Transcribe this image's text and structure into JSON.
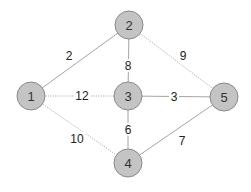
{
  "graph": {
    "nodes": [
      {
        "id": "1",
        "label": "1",
        "x": 31,
        "y": 96
      },
      {
        "id": "2",
        "label": "2",
        "x": 129,
        "y": 25
      },
      {
        "id": "3",
        "label": "3",
        "x": 128,
        "y": 96
      },
      {
        "id": "4",
        "label": "4",
        "x": 128,
        "y": 163
      },
      {
        "id": "5",
        "label": "5",
        "x": 224,
        "y": 97
      }
    ],
    "edges": [
      {
        "from": "1",
        "to": "2",
        "weight": "2",
        "style": "solid",
        "label_x": 69,
        "label_y": 56
      },
      {
        "from": "1",
        "to": "3",
        "weight": "12",
        "style": "dotted",
        "label_x": 82,
        "label_y": 96
      },
      {
        "from": "1",
        "to": "4",
        "weight": "10",
        "style": "dotted",
        "label_x": 77,
        "label_y": 139
      },
      {
        "from": "2",
        "to": "3",
        "weight": "8",
        "style": "solid",
        "label_x": 128,
        "label_y": 66
      },
      {
        "from": "2",
        "to": "5",
        "weight": "9",
        "style": "dotted",
        "label_x": 183,
        "label_y": 56
      },
      {
        "from": "3",
        "to": "5",
        "weight": "3",
        "style": "solid",
        "label_x": 174,
        "label_y": 97
      },
      {
        "from": "3",
        "to": "4",
        "weight": "6",
        "style": "solid",
        "label_x": 128,
        "label_y": 130
      },
      {
        "from": "4",
        "to": "5",
        "weight": "7",
        "style": "solid",
        "label_x": 182,
        "label_y": 141
      }
    ]
  },
  "colors": {
    "node_fill": "#c4c4c4",
    "node_stroke": "#8a8a8a",
    "edge": "#9a9a9a"
  }
}
